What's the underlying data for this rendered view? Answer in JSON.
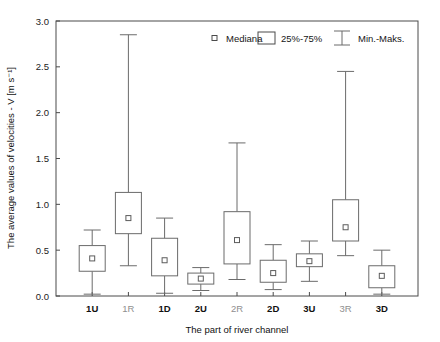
{
  "chart_data": {
    "type": "box",
    "title": "",
    "xlabel": "The part of river channel",
    "ylabel": "The average values of velocities - V [m s⁻¹]",
    "ylim": [
      0.0,
      3.0
    ],
    "ytick_labels": [
      "0.0",
      "0.5",
      "1.0",
      "1.5",
      "2.0",
      "2.5",
      "3.0"
    ],
    "ytick_values": [
      0.0,
      0.5,
      1.0,
      1.5,
      2.0,
      2.5,
      3.0
    ],
    "grid": false,
    "legend_position": "top-right",
    "legend": [
      {
        "key": "median",
        "label": "Mediana",
        "marker": "small-open-square"
      },
      {
        "key": "quartiles",
        "label": "25%-75%",
        "marker": "open-rectangle"
      },
      {
        "key": "range",
        "label": "Min.-Maks.",
        "marker": "whisker-bar"
      }
    ],
    "categories": [
      "1U",
      "1R",
      "1D",
      "2U",
      "2R",
      "2D",
      "3U",
      "3R",
      "3D"
    ],
    "boxes": [
      {
        "category": "1U",
        "min": 0.02,
        "q1": 0.27,
        "median": 0.41,
        "q3": 0.55,
        "max": 0.72
      },
      {
        "category": "1R",
        "min": 0.33,
        "q1": 0.68,
        "median": 0.85,
        "q3": 1.13,
        "max": 2.85
      },
      {
        "category": "1D",
        "min": 0.03,
        "q1": 0.22,
        "median": 0.39,
        "q3": 0.63,
        "max": 0.85
      },
      {
        "category": "2U",
        "min": 0.06,
        "q1": 0.13,
        "median": 0.19,
        "q3": 0.25,
        "max": 0.31
      },
      {
        "category": "2R",
        "min": 0.18,
        "q1": 0.35,
        "median": 0.61,
        "q3": 0.92,
        "max": 1.67
      },
      {
        "category": "2D",
        "min": 0.07,
        "q1": 0.15,
        "median": 0.25,
        "q3": 0.39,
        "max": 0.56
      },
      {
        "category": "3U",
        "min": 0.16,
        "q1": 0.32,
        "median": 0.38,
        "q3": 0.46,
        "max": 0.6
      },
      {
        "category": "3R",
        "min": 0.44,
        "q1": 0.6,
        "median": 0.75,
        "q3": 1.05,
        "max": 2.45
      },
      {
        "category": "3D",
        "min": 0.02,
        "q1": 0.09,
        "median": 0.22,
        "q3": 0.33,
        "max": 0.5
      }
    ],
    "colors": {
      "box_stroke": "#6b6b6b",
      "axis": "#4a4a4a",
      "background": "#ffffff",
      "text": "#111111"
    }
  }
}
